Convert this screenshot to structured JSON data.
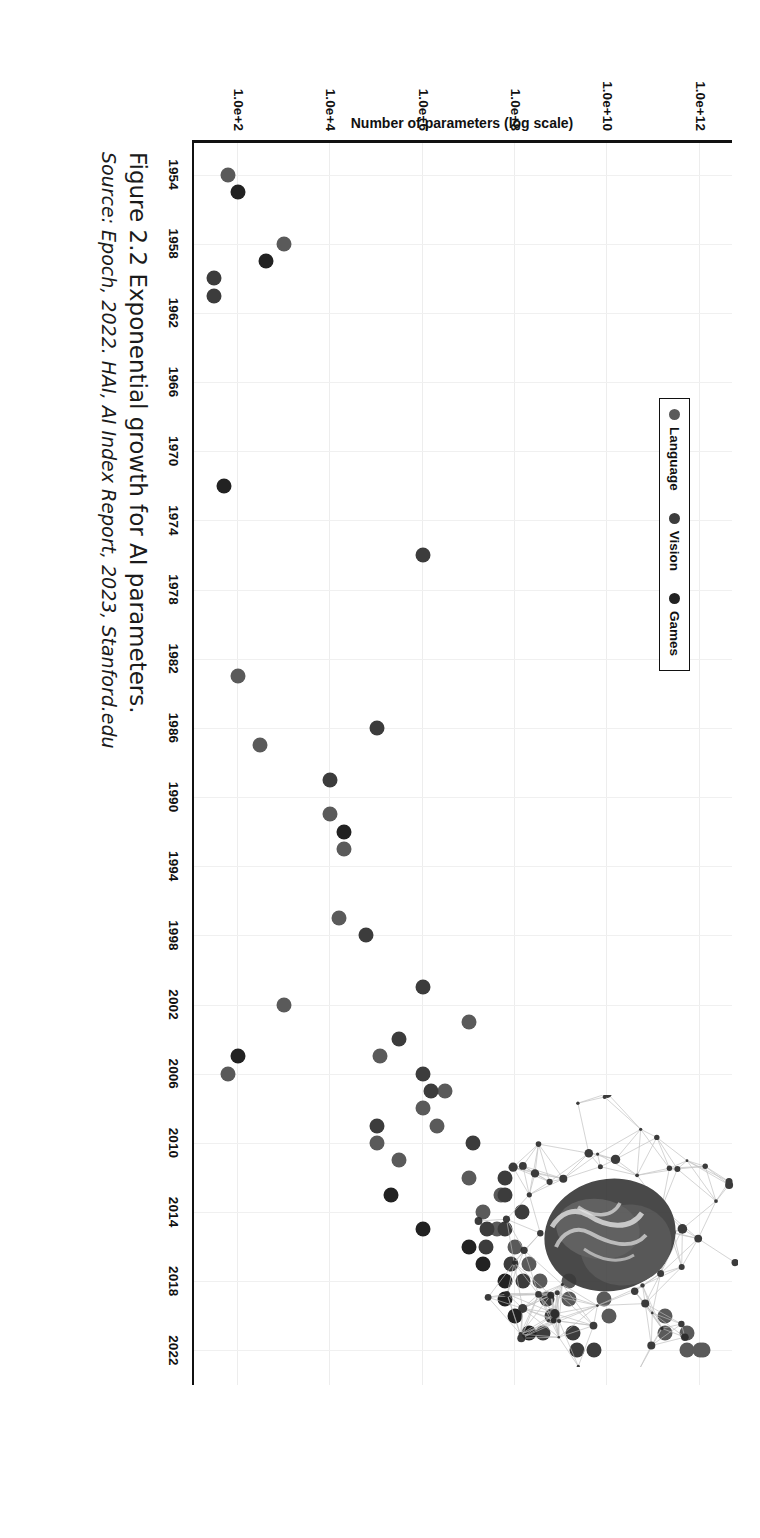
{
  "figure": {
    "caption_title": "Figure 2.2  Exponential growth for AI parameters.",
    "caption_source": "Source: Epoch, 2022. HAI, AI Index Report, 2023, Stanford.edu",
    "orientation": "rotated-90-clockwise",
    "watermark_name": "neural-network-brain-graphic"
  },
  "legend": {
    "items": [
      {
        "label": "Language",
        "color": "#5a5a5a"
      },
      {
        "label": "Vision",
        "color": "#3c3c3c"
      },
      {
        "label": "Games",
        "color": "#222222"
      }
    ]
  },
  "axes": {
    "y_label": "Number of parameters (log scale)",
    "y_ticks": [
      "1.0e+2",
      "1.0e+4",
      "1.0e+6",
      "1.0e+8",
      "1.0e+10",
      "1.0e+12"
    ],
    "y_tick_exponents": [
      2,
      4,
      6,
      8,
      10,
      12
    ],
    "x_ticks": [
      1954,
      1958,
      1962,
      1966,
      1970,
      1974,
      1978,
      1982,
      1986,
      1990,
      1994,
      1998,
      2002,
      2006,
      2010,
      2014,
      2018,
      2022
    ]
  },
  "chart_data": {
    "type": "scatter",
    "title": "Figure 2.2  Exponential growth for AI parameters.",
    "xlabel": "",
    "ylabel": "Number of parameters (log scale)",
    "yscale": "log",
    "xlim": [
      1952,
      2024
    ],
    "ylim": [
      10,
      5000000000000.0
    ],
    "grid": true,
    "legend_position": "top-left",
    "series": [
      {
        "name": "Language",
        "color": "#5a5a5a",
        "points": [
          [
            1954,
            60
          ],
          [
            1958,
            1000.0
          ],
          [
            1983,
            100.0
          ],
          [
            1987,
            300.0
          ],
          [
            1991,
            10000.0
          ],
          [
            1993,
            20000.0
          ],
          [
            1997,
            15000.0
          ],
          [
            2002,
            1000.0
          ],
          [
            2003,
            10000000.0
          ],
          [
            2005,
            120000.0
          ],
          [
            2006,
            60.0
          ],
          [
            2007,
            3000000.0
          ],
          [
            2008,
            1000000.0
          ],
          [
            2009,
            2000000.0
          ],
          [
            2010,
            100000.0
          ],
          [
            2011,
            300000.0
          ],
          [
            2012,
            10000000.0
          ],
          [
            2013,
            50000000.0
          ],
          [
            2014,
            20000000.0
          ],
          [
            2015,
            40000000.0
          ],
          [
            2016,
            100000000.0
          ],
          [
            2017,
            200000000.0
          ],
          [
            2018,
            340000000.0
          ],
          [
            2018,
            1500000000.0
          ],
          [
            2019,
            1500000000.0
          ],
          [
            2019,
            8300000000.0
          ],
          [
            2020,
            175000000000.0
          ],
          [
            2020,
            11000000000.0
          ],
          [
            2021,
            175000000000.0
          ],
          [
            2021,
            530000000000.0
          ],
          [
            2022,
            540000000000.0
          ],
          [
            2022,
            1000000000000.0
          ],
          [
            2022,
            1200000000000.0
          ]
        ]
      },
      {
        "name": "Vision",
        "color": "#3c3c3c",
        "points": [
          [
            1960,
            30.0
          ],
          [
            1961,
            30.0
          ],
          [
            1976,
            1000000.0
          ],
          [
            1986,
            100000.0
          ],
          [
            1989,
            10000.0
          ],
          [
            1998,
            60000.0
          ],
          [
            2001,
            1000000.0
          ],
          [
            2004,
            300000.0
          ],
          [
            2006,
            1000000.0
          ],
          [
            2007,
            1500000.0
          ],
          [
            2009,
            100000.0
          ],
          [
            2010,
            12000000.0
          ],
          [
            2012,
            60000000.0
          ],
          [
            2013,
            60000000.0
          ],
          [
            2014,
            140000000.0
          ],
          [
            2015,
            25000000.0
          ],
          [
            2015,
            60000000.0
          ],
          [
            2016,
            23000000.0
          ],
          [
            2017,
            80000000.0
          ],
          [
            2018,
            150000000.0
          ],
          [
            2019,
            480000000.0
          ],
          [
            2020,
            630000000.0
          ],
          [
            2021,
            1800000000.0
          ],
          [
            2021,
            400000000.0
          ],
          [
            2022,
            2200000000.0
          ],
          [
            2022,
            5000000000.0
          ]
        ]
      },
      {
        "name": "Games",
        "color": "#222222",
        "points": [
          [
            1955,
            100.0
          ],
          [
            1959,
            400.0
          ],
          [
            1972,
            50.0
          ],
          [
            1992,
            20000.0
          ],
          [
            2005,
            100.0
          ],
          [
            2013,
            200000.0
          ],
          [
            2015,
            1000000.0
          ],
          [
            2016,
            10000000.0
          ],
          [
            2017,
            20000000.0
          ],
          [
            2018,
            60000000.0
          ],
          [
            2019,
            60000000.0
          ],
          [
            2020,
            100000000.0
          ],
          [
            2021,
            200000000.0
          ]
        ]
      }
    ]
  }
}
